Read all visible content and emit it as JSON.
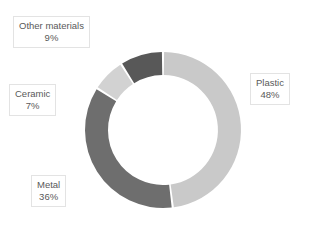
{
  "chart_data": {
    "type": "pie",
    "variant": "donut",
    "title": "",
    "subtitle": "",
    "xlabel": "",
    "ylabel": "",
    "grid": false,
    "legend": "none",
    "labels_position": "outside-callout-boxes",
    "start_angle_deg": 0,
    "direction": "clockwise",
    "units": "percent",
    "total": 100,
    "categories": [
      "Plastic",
      "Metal",
      "Other materials",
      "Ceramic"
    ],
    "values": [
      48,
      36,
      9,
      7
    ],
    "slices": [
      {
        "label": "Plastic",
        "value": 48,
        "value_text": "48%",
        "color": "#c9c9c9",
        "start_deg": 0,
        "end_deg": 172.8
      },
      {
        "label": "Metal",
        "value": 36,
        "value_text": "36%",
        "color": "#6e6e6e",
        "start_deg": 172.8,
        "end_deg": 302.4
      },
      {
        "label": "Ceramic",
        "value": 7,
        "value_text": "7%",
        "color": "#d2d2d2",
        "start_deg": 302.4,
        "end_deg": 327.6
      },
      {
        "label": "Other materials",
        "value": 9,
        "value_text": "9%",
        "color": "#585858",
        "start_deg": 327.6,
        "end_deg": 360
      }
    ]
  },
  "callouts": {
    "other_materials": {
      "category": "Other materials",
      "percent": "9%"
    },
    "ceramic": {
      "category": "Ceramic",
      "percent": "7%"
    },
    "metal": {
      "category": "Metal",
      "percent": "36%"
    },
    "plastic": {
      "category": "Plastic",
      "percent": "48%"
    }
  },
  "style": {
    "background": "#ffffff",
    "text_color": "#595959",
    "callout_border": "#e3e3e3",
    "separator_color": "#ffffff"
  }
}
